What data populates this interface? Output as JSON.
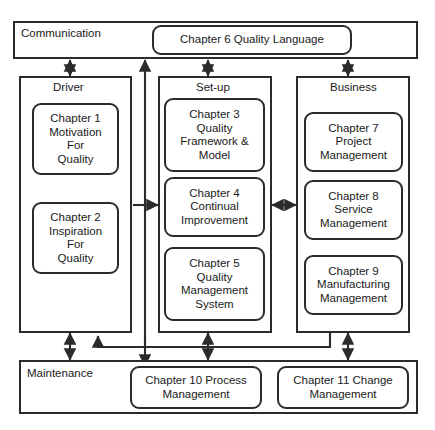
{
  "diagram": {
    "colors": {
      "stroke": "#2b2b2b",
      "text": "#1a1a1a",
      "background": "#ffffff"
    },
    "groups": [
      {
        "id": "communication",
        "label": "Communication"
      },
      {
        "id": "driver",
        "label": "Driver"
      },
      {
        "id": "setup",
        "label": "Set-up"
      },
      {
        "id": "business",
        "label": "Business"
      },
      {
        "id": "maintenance",
        "label": "Maintenance"
      }
    ],
    "nodes": {
      "chapter6": {
        "lines": [
          "Chapter 6 Quality Language"
        ]
      },
      "chapter1": {
        "lines": [
          "Chapter 1",
          "Motivation",
          "For",
          "Quality"
        ]
      },
      "chapter2": {
        "lines": [
          "Chapter 2",
          "Inspiration",
          "For",
          "Quality"
        ]
      },
      "chapter3": {
        "lines": [
          "Chapter 3",
          "Quality",
          "Framework &",
          "Model"
        ]
      },
      "chapter4": {
        "lines": [
          "Chapter 4",
          "Continual",
          "Improvement"
        ]
      },
      "chapter5": {
        "lines": [
          "Chapter 5",
          "Quality",
          "Management",
          "System"
        ]
      },
      "chapter7": {
        "lines": [
          "Chapter 7",
          "Project",
          "Management"
        ]
      },
      "chapter8": {
        "lines": [
          "Chapter 8",
          "Service",
          "Management"
        ]
      },
      "chapter9": {
        "lines": [
          "Chapter 9",
          "Manufacturing",
          "Management"
        ]
      },
      "chapter10": {
        "lines": [
          "Chapter 10 Process",
          "Management"
        ]
      },
      "chapter11": {
        "lines": [
          "Chapter 11 Change",
          "Management"
        ]
      }
    },
    "connectors": [
      {
        "id": "communication-driver",
        "from": "communication",
        "to": "driver",
        "style": "double-arrow",
        "orientation": "vertical"
      },
      {
        "id": "communication-setup",
        "from": "communication",
        "to": "setup",
        "style": "double-arrow",
        "orientation": "vertical"
      },
      {
        "id": "communication-business",
        "from": "communication",
        "to": "business",
        "style": "double-arrow",
        "orientation": "vertical"
      },
      {
        "id": "maintenance-communication",
        "from": "maintenance",
        "to": "communication",
        "style": "single-arrow",
        "orientation": "vertical"
      },
      {
        "id": "spine-setup",
        "from": "spine",
        "to": "setup",
        "style": "single-arrow",
        "orientation": "horizontal"
      },
      {
        "id": "setup-business",
        "from": "setup",
        "to": "business",
        "style": "double-arrow",
        "orientation": "horizontal"
      },
      {
        "id": "driver-maintenance",
        "from": "driver",
        "to": "maintenance",
        "style": "double-arrow",
        "orientation": "vertical"
      },
      {
        "id": "setup-maintenance",
        "from": "setup",
        "to": "maintenance",
        "style": "double-arrow",
        "orientation": "vertical"
      },
      {
        "id": "business-maintenance",
        "from": "business",
        "to": "maintenance",
        "style": "double-arrow",
        "orientation": "vertical"
      },
      {
        "id": "business-driver-return",
        "from": "business",
        "to": "driver",
        "style": "single-arrow",
        "orientation": "elbow"
      },
      {
        "id": "spine-chapter10",
        "from": "spine",
        "to": "chapter10",
        "style": "single-arrow",
        "orientation": "vertical"
      }
    ]
  }
}
